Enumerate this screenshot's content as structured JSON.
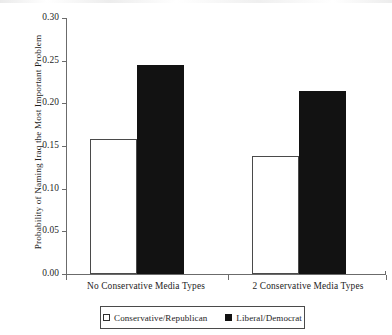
{
  "chart_data": {
    "type": "bar",
    "title": "",
    "xlabel": "",
    "ylabel": "Probability of Naming Iraq the Most Important Problem",
    "ylim": [
      0.0,
      0.3
    ],
    "ytick_labels": [
      "0.00",
      "0.05",
      "0.10",
      "0.15",
      "0.20",
      "0.25",
      "0.30"
    ],
    "ytick_values": [
      0.0,
      0.05,
      0.1,
      0.15,
      0.2,
      0.25,
      0.3
    ],
    "grid": false,
    "legend_position": "bottom-center",
    "categories": [
      "No Conservative Media Types",
      "2 Conservative Media Types"
    ],
    "series": [
      {
        "name": "Conservative/Republican",
        "style": "open",
        "color": "#ffffff",
        "edge_color": "#4a4a4a",
        "values": [
          0.158,
          0.138
        ]
      },
      {
        "name": "Liberal/Democrat",
        "style": "filled",
        "color": "#121212",
        "edge_color": "#121212",
        "values": [
          0.245,
          0.214
        ]
      }
    ]
  },
  "axes": {
    "y_title": "Probability of Naming Iraq the Most Important Problem",
    "y_ticks": [
      {
        "label": "0.30",
        "value": 0.3
      },
      {
        "label": "0.25",
        "value": 0.25
      },
      {
        "label": "0.20",
        "value": 0.2
      },
      {
        "label": "0.15",
        "value": 0.15
      },
      {
        "label": "0.10",
        "value": 0.1
      },
      {
        "label": "0.05",
        "value": 0.05
      },
      {
        "label": "0.00",
        "value": 0.0
      }
    ],
    "x_categories": [
      {
        "label": "No Conservative Media Types"
      },
      {
        "label": "2 Conservative Media Types"
      }
    ]
  },
  "legend": {
    "entries": [
      {
        "label": "Conservative/Republican",
        "swatch": "open-square-icon"
      },
      {
        "label": "Liberal/Democrat",
        "swatch": "filled-square-icon"
      }
    ]
  }
}
